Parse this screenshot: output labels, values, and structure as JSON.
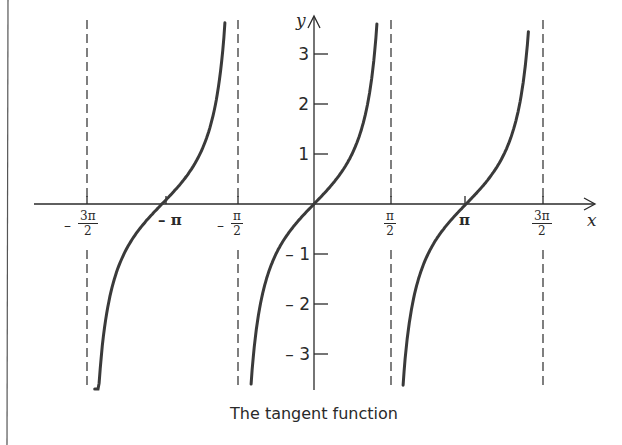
{
  "chart_data": {
    "type": "line",
    "title": "The tangent function",
    "function": "y = tan(x)",
    "xlabel": "x",
    "ylabel": "y",
    "xlim": [
      -4.92,
      5.6
    ],
    "ylim": [
      -3.7,
      3.7
    ],
    "grid": false,
    "legend": null,
    "x_ticks": [
      {
        "value": -4.712,
        "label": "-3π/2"
      },
      {
        "value": -3.1416,
        "label": "-π"
      },
      {
        "value": -1.5708,
        "label": "-π/2"
      },
      {
        "value": 1.5708,
        "label": "π/2"
      },
      {
        "value": 3.1416,
        "label": "π"
      },
      {
        "value": 4.712,
        "label": "3π/2"
      }
    ],
    "y_ticks": [
      -3,
      -2,
      -1,
      1,
      2,
      3
    ],
    "asymptotes": [
      {
        "x": -4.712,
        "label": "-3π/2",
        "style": "dashed"
      },
      {
        "x": -1.5708,
        "label": "-π/2",
        "style": "dashed"
      },
      {
        "x": 1.5708,
        "label": "π/2",
        "style": "dashed"
      },
      {
        "x": 4.712,
        "label": "3π/2",
        "style": "dashed"
      }
    ],
    "series": [
      {
        "name": "tan(x) branch 1",
        "x_range": [
          -4.53,
          -1.84
        ],
        "points": [
          [
            -4.53,
            -3.7
          ],
          [
            -4.2,
            -1.89
          ],
          [
            -3.9,
            -0.95
          ],
          [
            -3.5,
            -0.37
          ],
          [
            -3.1416,
            0
          ],
          [
            -2.8,
            0.36
          ],
          [
            -2.4,
            0.92
          ],
          [
            -2.1,
            1.71
          ],
          [
            -1.84,
            3.7
          ]
        ]
      },
      {
        "name": "tan(x) branch 2",
        "x_range": [
          -1.3,
          1.3
        ],
        "points": [
          [
            -1.3,
            -3.6
          ],
          [
            -1.1,
            -1.96
          ],
          [
            -0.8,
            -1.03
          ],
          [
            -0.4,
            -0.42
          ],
          [
            0,
            0
          ],
          [
            0.4,
            0.42
          ],
          [
            0.8,
            1.03
          ],
          [
            1.1,
            1.96
          ],
          [
            1.3,
            3.6
          ]
        ]
      },
      {
        "name": "tan(x) branch 3",
        "x_range": [
          1.84,
          4.43
        ],
        "points": [
          [
            1.84,
            -3.7
          ],
          [
            2.1,
            -1.71
          ],
          [
            2.4,
            -0.92
          ],
          [
            2.8,
            -0.36
          ],
          [
            3.1416,
            0
          ],
          [
            3.5,
            0.37
          ],
          [
            3.9,
            0.95
          ],
          [
            4.2,
            1.89
          ],
          [
            4.43,
            3.6
          ]
        ]
      }
    ],
    "annotations": []
  },
  "labels": {
    "x_axis": "x",
    "y_axis": "y",
    "y_ticks": [
      "3",
      "2",
      "1",
      "– 1",
      "– 2",
      "– 3"
    ],
    "x_neg_3pi2": {
      "sign": "–",
      "num": "3π",
      "den": "2"
    },
    "x_neg_pi": "– π",
    "x_neg_pi2": {
      "sign": "–",
      "num": "π",
      "den": "2"
    },
    "x_pi2": {
      "num": "π",
      "den": "2"
    },
    "x_pi": "π",
    "x_3pi2": {
      "num": "3π",
      "den": "2"
    },
    "caption": "The tangent function"
  },
  "colors": {
    "ink": "#2a2a2a",
    "curve": "#3a3a3a",
    "background": "#ffffff"
  }
}
